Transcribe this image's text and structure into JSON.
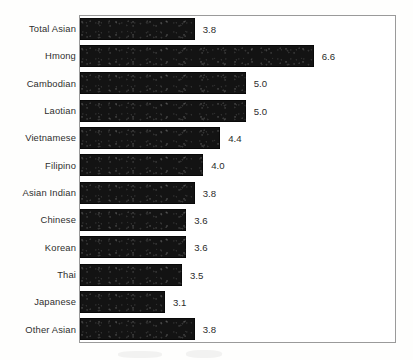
{
  "chart_data": {
    "type": "bar",
    "orientation": "horizontal",
    "title": "",
    "subtitle": "",
    "xlabel": "",
    "ylabel": "",
    "categories": [
      "Total Asian",
      "Hmong",
      "Cambodian",
      "Laotian",
      "Vietnamese",
      "Filipino",
      "Asian Indian",
      "Chinese",
      "Korean",
      "Thai",
      "Japanese",
      "Other Asian"
    ],
    "values": [
      3.8,
      6.6,
      5.0,
      5.0,
      4.4,
      4.0,
      3.8,
      3.6,
      3.6,
      3.5,
      3.1,
      3.8
    ],
    "value_labels": [
      "3.8",
      "6.6",
      "5.0",
      "5.0",
      "4.4",
      "4.0",
      "3.8",
      "3.6",
      "3.6",
      "3.5",
      "3.1",
      "3.8"
    ],
    "axis_visible_baseline": 1.1,
    "xlim": [
      1.1,
      6.9
    ],
    "grid": false,
    "legend": null,
    "bar_color": "#131313",
    "frame_color": "#9a9a9a",
    "label_color": "#2e2e2e"
  }
}
